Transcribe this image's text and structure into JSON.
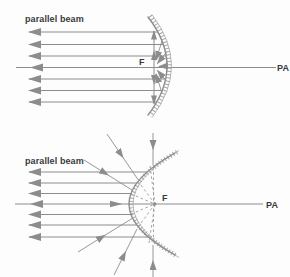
{
  "figure": {
    "top": {
      "parallel_beam_label": "parallel beam",
      "focal_point_label": "F",
      "principal_axis_label": "PA"
    },
    "bottom": {
      "parallel_beam_label": "parallel beam",
      "focal_point_label": "F",
      "principal_axis_label": "PA"
    }
  },
  "colors": {
    "background": "#fdfdfd",
    "line_gray": "#8c8c8c",
    "hatch_gray": "#a6a6a6",
    "dash_gray": "#9a9a9a",
    "text_dark": "#3a3a3a"
  }
}
